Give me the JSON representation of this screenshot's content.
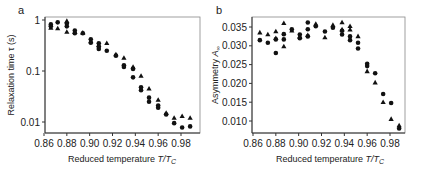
{
  "chart_data": [
    {
      "panel": "a",
      "type": "scatter",
      "title": "",
      "xlabel": "Reduced temperature T/T_C",
      "ylabel": "Relaxation time τ (s)",
      "yscale": "log",
      "xlim": [
        0.86,
        0.99
      ],
      "ylim": [
        0.006,
        1.2
      ],
      "xticks": [
        "0.86",
        "0.88",
        "0.90",
        "0.92",
        "0.94",
        "0.96",
        "0.98"
      ],
      "yticks": [
        "0.01",
        "0.1",
        "1"
      ],
      "grid": false,
      "legend": "none",
      "series": [
        {
          "name": "circles",
          "marker": "circle",
          "x": [
            0.866,
            0.866,
            0.872,
            0.88,
            0.88,
            0.887,
            0.887,
            0.894,
            0.901,
            0.901,
            0.908,
            0.908,
            0.908,
            0.915,
            0.923,
            0.93,
            0.93,
            0.938,
            0.938,
            0.945,
            0.945,
            0.952,
            0.952,
            0.96,
            0.96,
            0.967,
            0.974,
            0.981,
            0.988
          ],
          "y": [
            0.82,
            0.75,
            0.9,
            0.85,
            0.75,
            0.62,
            0.55,
            0.55,
            0.42,
            0.36,
            0.35,
            0.3,
            0.27,
            0.25,
            0.2,
            0.13,
            0.12,
            0.11,
            0.075,
            0.048,
            0.042,
            0.03,
            0.025,
            0.021,
            0.019,
            0.014,
            0.0095,
            0.0078,
            0.0082
          ]
        },
        {
          "name": "triangles",
          "marker": "triangle",
          "x": [
            0.866,
            0.872,
            0.88,
            0.88,
            0.887,
            0.894,
            0.901,
            0.908,
            0.915,
            0.923,
            0.93,
            0.938,
            0.945,
            0.952,
            0.96,
            0.967,
            0.974,
            0.981,
            0.988
          ],
          "y": [
            0.7,
            0.68,
            0.58,
            0.95,
            0.58,
            0.56,
            0.38,
            0.32,
            0.35,
            0.21,
            0.18,
            0.12,
            0.08,
            0.045,
            0.027,
            0.015,
            0.012,
            0.013,
            0.012
          ]
        }
      ]
    },
    {
      "panel": "b",
      "type": "scatter",
      "title": "",
      "xlabel": "Reduced temperature T/T_C",
      "ylabel": "Asymmetry A∞",
      "xlim": [
        0.86,
        0.99
      ],
      "ylim": [
        0.0075,
        0.0375
      ],
      "xticks": [
        "0.86",
        "0.88",
        "0.90",
        "0.92",
        "0.94",
        "0.96",
        "0.98"
      ],
      "yticks": [
        "0.010",
        "0.015",
        "0.020",
        "0.025",
        "0.030",
        "0.035"
      ],
      "grid": false,
      "legend": "none",
      "series": [
        {
          "name": "circles",
          "marker": "circle",
          "x": [
            0.866,
            0.873,
            0.88,
            0.88,
            0.887,
            0.887,
            0.894,
            0.901,
            0.901,
            0.908,
            0.908,
            0.908,
            0.915,
            0.923,
            0.93,
            0.938,
            0.938,
            0.945,
            0.945,
            0.952,
            0.952,
            0.96,
            0.96,
            0.967,
            0.974,
            0.981,
            0.988
          ],
          "y": [
            0.0315,
            0.0308,
            0.0281,
            0.0317,
            0.0331,
            0.0317,
            0.0344,
            0.033,
            0.032,
            0.0362,
            0.0344,
            0.0325,
            0.0352,
            0.0338,
            0.0348,
            0.034,
            0.033,
            0.0325,
            0.0315,
            0.0308,
            0.0293,
            0.0252,
            0.0246,
            0.0227,
            0.0172,
            0.0148,
            0.008
          ]
        },
        {
          "name": "triangles",
          "marker": "triangle",
          "x": [
            0.866,
            0.873,
            0.88,
            0.88,
            0.887,
            0.887,
            0.894,
            0.901,
            0.908,
            0.915,
            0.923,
            0.93,
            0.938,
            0.938,
            0.945,
            0.945,
            0.952,
            0.96,
            0.967,
            0.974,
            0.981,
            0.988
          ],
          "y": [
            0.0335,
            0.033,
            0.0338,
            0.032,
            0.036,
            0.0298,
            0.034,
            0.0325,
            0.0328,
            0.0358,
            0.0322,
            0.0355,
            0.0362,
            0.0343,
            0.0352,
            0.0343,
            0.0325,
            0.0232,
            0.0202,
            0.015,
            0.0105,
            0.0088
          ]
        }
      ]
    }
  ],
  "panels": {
    "a": {
      "label": "a",
      "xlabel_main": "Reduced temperature ",
      "xlabel_italic": "T/T",
      "xlabel_sub": "C",
      "ylabel": "Relaxation time τ (s)"
    },
    "b": {
      "label": "b",
      "xlabel_main": "Reduced temperature ",
      "xlabel_italic": "T/T",
      "xlabel_sub": "C",
      "ylabel_main": "Asymmetry ",
      "ylabel_italic": "A",
      "ylabel_sub": "∞"
    }
  },
  "colors": {
    "marker": "#111111",
    "axis": "#333333",
    "frame": "#888888"
  }
}
